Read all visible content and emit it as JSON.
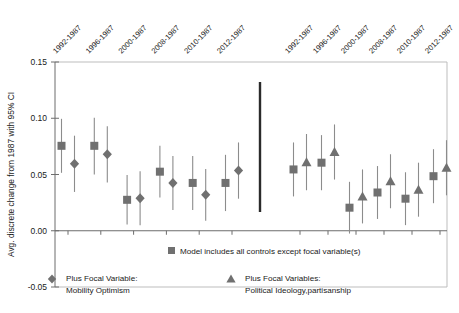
{
  "chart_data": {
    "type": "scatter",
    "title": "",
    "xlabel": "",
    "ylabel": "Avg. discrete change from 1987 with 95% CI",
    "ylim": [
      -0.05,
      0.15
    ],
    "yticks": [
      "-0.05",
      "0.00",
      "0.05",
      "0.10",
      "0.15"
    ],
    "ytick_values": [
      -0.05,
      0.0,
      0.05,
      0.1,
      0.15
    ],
    "grid": false,
    "legend_position": "bottom",
    "panels": [
      {
        "name": "left-panel",
        "focal_label": "Plus Focal Variable:",
        "focal_name": "Mobility Optimism",
        "categories": [
          "1992-1987",
          "1996-1987",
          "2000-1987",
          "2008-1987",
          "2010-1987",
          "2012-1987"
        ],
        "series": [
          {
            "name": "Model includes all controls except focal variable(s)",
            "marker": "square",
            "values": [
              0.0755,
              0.0755,
              0.0275,
              0.0525,
              0.0425,
              0.0425
            ],
            "ci_low": [
              0.0515,
              0.05,
              0.0055,
              0.0295,
              0.0185,
              0.0175
            ],
            "ci_high": [
              0.0995,
              0.1005,
              0.0495,
              0.0755,
              0.0665,
              0.0675
            ]
          },
          {
            "name": "Plus Focal Variable: Mobility Optimism",
            "marker": "diamond",
            "values": [
              0.0595,
              0.068,
              0.029,
              0.0425,
              0.032,
              0.0535
            ],
            "ci_low": [
              0.0345,
              0.043,
              0.005,
              0.0185,
              0.009,
              0.0285
            ],
            "ci_high": [
              0.0845,
              0.093,
              0.053,
              0.0665,
              0.055,
              0.0785
            ]
          }
        ]
      },
      {
        "name": "right-panel",
        "focal_label": "Plus Focal Variables:",
        "focal_name": "Political Ideology,partisanship",
        "categories": [
          "1992-1987",
          "1996-1987",
          "2000-1987",
          "2008-1987",
          "2010-1987",
          "2012-1987"
        ],
        "series": [
          {
            "name": "Model includes all controls except focal variable(s)",
            "marker": "square",
            "values": [
              0.0545,
              0.0605,
              0.0205,
              0.034,
              0.0285,
              0.0485
            ],
            "ci_low": [
              0.0305,
              0.036,
              -0.0025,
              0.0105,
              0.005,
              0.0245
            ],
            "ci_high": [
              0.0785,
              0.085,
              0.0435,
              0.0575,
              0.052,
              0.0725
            ]
          },
          {
            "name": "Plus Focal Variables: Political Ideology,partisanship",
            "marker": "triangle",
            "values": [
              0.061,
              0.07,
              0.0305,
              0.044,
              0.0365,
              0.056
            ],
            "ci_low": [
              0.036,
              0.0455,
              0.0065,
              0.02,
              0.0125,
              0.0315
            ],
            "ci_high": [
              0.086,
              0.0945,
              0.0545,
              0.068,
              0.0605,
              0.0805
            ]
          }
        ]
      }
    ],
    "legend": [
      {
        "marker": "square",
        "text": "Model includes all controls except focal variable(s)"
      },
      {
        "marker": "diamond",
        "line1": "Plus Focal Variable:",
        "line2": "Mobility Optimism"
      },
      {
        "marker": "triangle",
        "line1": "Plus Focal Variables:",
        "line2": "Political Ideology,partisanship"
      }
    ],
    "colors": {
      "marker": "#707070",
      "error_bar": "#8c8c8c",
      "axis": "#6d6d6d",
      "frame": "#bdbdbd",
      "divider": "#2b2b2b",
      "text": "#1a1a1a",
      "background": "#ffffff"
    },
    "divider": {
      "present": true,
      "description": "vertical separator between the two panels"
    }
  }
}
